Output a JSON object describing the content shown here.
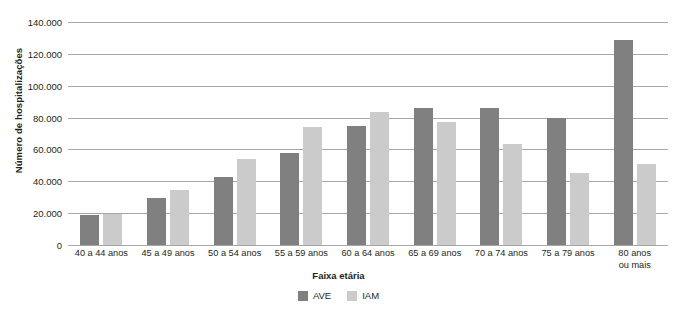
{
  "chart_data": {
    "type": "bar",
    "title": "",
    "xlabel": "Faixa etária",
    "ylabel": "Número de hospitalizações",
    "ylim": [
      0,
      140000
    ],
    "ytick_step": 20000,
    "grid": true,
    "legend_position": "bottom",
    "categories": [
      "40 a 44 anos",
      "45 a 49 anos",
      "50 a 54 anos",
      "55 a 59 anos",
      "60 a 64 anos",
      "65 a 69 anos",
      "70 a 74 anos",
      "75 a 79 anos",
      "80 anos\nou mais"
    ],
    "ytick_labels": [
      "140.000",
      "120.000",
      "100.000",
      "80.000",
      "60.000",
      "40.000",
      "20.000",
      "0"
    ],
    "ytick_values": [
      140000,
      120000,
      100000,
      80000,
      60000,
      40000,
      20000,
      0
    ],
    "series": [
      {
        "name": "AVE",
        "color": "#808080",
        "values": [
          19000,
          29500,
          43000,
          58000,
          75000,
          86000,
          86000,
          79500,
          129000
        ]
      },
      {
        "name": "IAM",
        "color": "#cbcbcb",
        "values": [
          19500,
          34500,
          54000,
          74000,
          83500,
          77500,
          63500,
          45000,
          51000
        ]
      }
    ]
  }
}
